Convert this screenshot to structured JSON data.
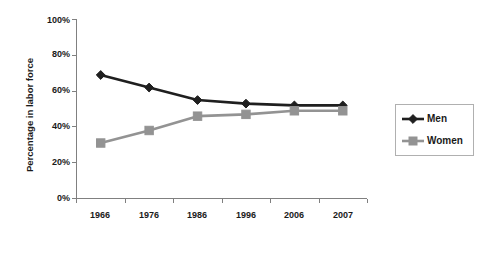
{
  "chart_data": {
    "type": "line",
    "title": "",
    "xlabel": "",
    "ylabel": "Percentage in labor force",
    "categories": [
      "1966",
      "1976",
      "1986",
      "1996",
      "2006",
      "2007"
    ],
    "series": [
      {
        "name": "Men",
        "values": [
          69,
          62,
          55,
          53,
          52,
          52
        ],
        "color": "#1f1f1f",
        "marker": "diamond"
      },
      {
        "name": "Women",
        "values": [
          31,
          38,
          46,
          47,
          49,
          49
        ],
        "color": "#939393",
        "marker": "square"
      }
    ],
    "ylim": [
      0,
      100
    ],
    "ytick_values": [
      0,
      20,
      40,
      60,
      80,
      100
    ],
    "ytick_labels": [
      "0%",
      "20%",
      "40%",
      "60%",
      "80%",
      "100%"
    ],
    "grid": false,
    "legend_position": "right",
    "legend_entries": [
      "Men",
      "Women"
    ]
  }
}
